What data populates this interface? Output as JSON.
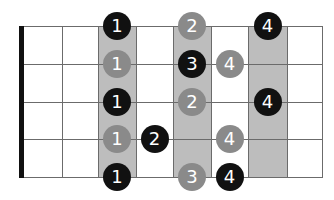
{
  "diagram": {
    "type": "guitar-fretboard-scale-pattern",
    "strings": 5,
    "frets": 8,
    "colors": {
      "highlight_band": "#bdbdbd",
      "grid_line": "#6b6b6b",
      "nut": "#111111",
      "dot_black": "#111111",
      "dot_gray": "#8a8a8a",
      "dot_text": "#ffffff"
    },
    "highlighted_fret_columns": [
      3,
      5,
      7
    ],
    "dots": [
      {
        "string": 1,
        "fret": 3,
        "finger": "1",
        "color": "black"
      },
      {
        "string": 1,
        "fret": 5,
        "finger": "2",
        "color": "gray"
      },
      {
        "string": 1,
        "fret": 7,
        "finger": "4",
        "color": "black"
      },
      {
        "string": 2,
        "fret": 3,
        "finger": "1",
        "color": "gray"
      },
      {
        "string": 2,
        "fret": 5,
        "finger": "3",
        "color": "black"
      },
      {
        "string": 2,
        "fret": 6,
        "finger": "4",
        "color": "gray"
      },
      {
        "string": 3,
        "fret": 3,
        "finger": "1",
        "color": "black"
      },
      {
        "string": 3,
        "fret": 5,
        "finger": "2",
        "color": "gray"
      },
      {
        "string": 3,
        "fret": 7,
        "finger": "4",
        "color": "black"
      },
      {
        "string": 4,
        "fret": 3,
        "finger": "1",
        "color": "gray"
      },
      {
        "string": 4,
        "fret": 4,
        "finger": "2",
        "color": "black"
      },
      {
        "string": 4,
        "fret": 6,
        "finger": "4",
        "color": "gray"
      },
      {
        "string": 5,
        "fret": 3,
        "finger": "1",
        "color": "black"
      },
      {
        "string": 5,
        "fret": 5,
        "finger": "3",
        "color": "gray"
      },
      {
        "string": 5,
        "fret": 6,
        "finger": "4",
        "color": "black"
      }
    ]
  }
}
